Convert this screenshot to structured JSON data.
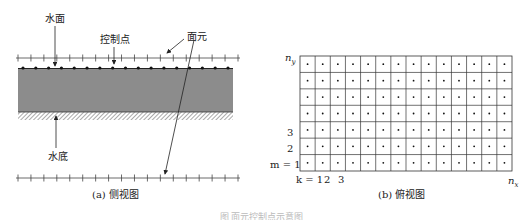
{
  "side_view": {
    "labels": {
      "water_surface": "水面",
      "control_point": "控制点",
      "surface_element": "面元",
      "water_bottom": "水底"
    },
    "caption": "(a) 侧视图",
    "top_ticks": 18,
    "bottom_ticks": 18,
    "control_points": 17,
    "colors": {
      "water_body": "#8c8c8c",
      "line": "#333333"
    }
  },
  "top_view": {
    "caption": "(b) 俯视图",
    "rows": 7,
    "cols": 14,
    "y_axis": {
      "top_label": "n",
      "top_sub": "y",
      "labels": [
        "m = 1",
        "2",
        "3"
      ]
    },
    "x_axis": {
      "labels": [
        "k = 1",
        "2",
        "3"
      ],
      "end_label": "n",
      "end_sub": "x"
    }
  },
  "figure_caption": "图  面元控制点示意图"
}
